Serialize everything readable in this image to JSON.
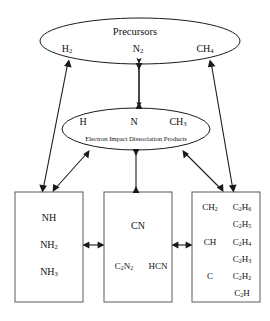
{
  "diagram": {
    "stroke_color": "#1a1a1a",
    "box_stroke_color": "#555555",
    "background": "#ffffff"
  },
  "precursor_ellipse": {
    "title": "Precursors",
    "species": [
      {
        "formula": "H",
        "sub": "2"
      },
      {
        "formula": "N",
        "sub": "2"
      },
      {
        "formula": "CH",
        "sub": "4"
      }
    ]
  },
  "dissociation_ellipse": {
    "caption": "Electron Impact Dissociation Products",
    "species": [
      {
        "formula": "H",
        "sub": ""
      },
      {
        "formula": "N",
        "sub": ""
      },
      {
        "formula": "CH",
        "sub": "3"
      }
    ]
  },
  "boxes": [
    {
      "id": "amine-box",
      "column_left": [
        {
          "formula": "NH",
          "sub": ""
        },
        {
          "formula": "NH",
          "sub": "2"
        },
        {
          "formula": "NH",
          "sub": "3"
        }
      ],
      "column_right": []
    },
    {
      "id": "cyanide-box",
      "column_left": [
        {
          "formula": "CN",
          "sub": ""
        },
        {
          "formula": "C",
          "sub": "2",
          "formula2": "N",
          "sub2": "2"
        }
      ],
      "column_right": [
        {
          "formula": "HCN",
          "sub": ""
        }
      ]
    },
    {
      "id": "hydrocarbon-box",
      "column_left": [
        {
          "formula": "CH",
          "sub": "2"
        },
        {
          "formula": "CH",
          "sub": ""
        },
        {
          "formula": "C",
          "sub": ""
        }
      ],
      "column_right": [
        {
          "formula": "C",
          "sub": "2",
          "formula2": "H",
          "sub2": "6"
        },
        {
          "formula": "C",
          "sub": "2",
          "formula2": "H",
          "sub2": "5"
        },
        {
          "formula": "C",
          "sub": "2",
          "formula2": "H",
          "sub2": "4"
        },
        {
          "formula": "C",
          "sub": "2",
          "formula2": "H",
          "sub2": "3"
        },
        {
          "formula": "C",
          "sub": "2",
          "formula2": "H",
          "sub2": "2"
        },
        {
          "formula": "C",
          "sub": "2",
          "formula2": "H",
          "sub2": ""
        }
      ]
    }
  ]
}
